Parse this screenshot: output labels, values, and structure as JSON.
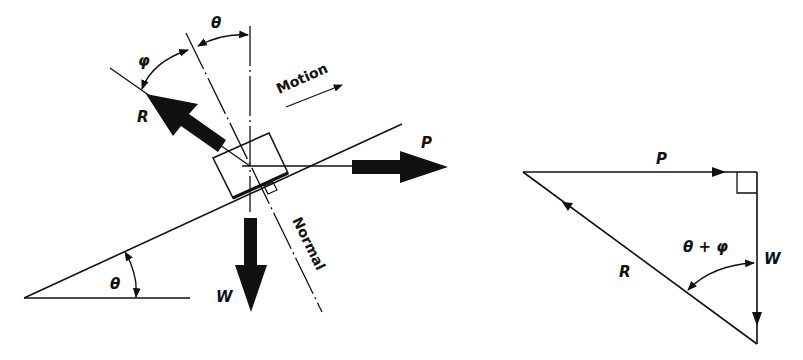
{
  "diagram": {
    "colors": {
      "ink": "#111111",
      "background": "#ffffff"
    },
    "left_figure": {
      "labels": {
        "phi": "φ",
        "theta_top": "θ",
        "theta_base": "θ",
        "R": "R",
        "P": "P",
        "W": "W",
        "motion": "Motion",
        "normal": "Normal"
      },
      "forces": [
        {
          "name": "R",
          "direction": "up-left, reaction"
        },
        {
          "name": "P",
          "direction": "horizontal right, applied"
        },
        {
          "name": "W",
          "direction": "vertical down, weight"
        }
      ]
    },
    "right_figure": {
      "labels": {
        "P": "P",
        "W": "W",
        "R": "R",
        "angle": "θ + φ"
      }
    }
  }
}
